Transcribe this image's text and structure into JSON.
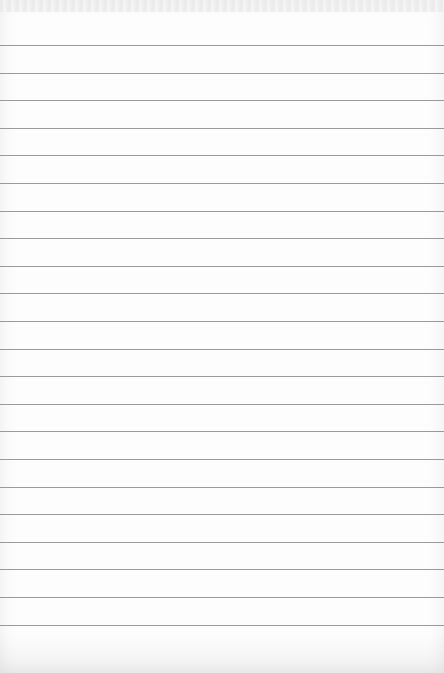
{
  "paper": {
    "type": "lined-notepad-sheet",
    "background_color": "#fdfdfd",
    "line_color": "#9a9a9a",
    "line_count": 22,
    "first_line_y": 45,
    "line_spacing": 27.6,
    "text": ""
  }
}
